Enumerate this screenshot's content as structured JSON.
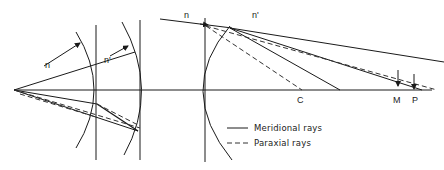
{
  "left_diagram": {
    "labels": {
      "n": "n",
      "n_prime": "n'"
    }
  },
  "right_diagram": {
    "labels": {
      "n": "n",
      "n_prime": "n'",
      "C": "C",
      "M": "M",
      "P": "P"
    }
  },
  "legend": {
    "items": [
      {
        "style": "solid",
        "label": "Meridional rays"
      },
      {
        "style": "dashed",
        "label": "Paraxial rays"
      }
    ]
  }
}
